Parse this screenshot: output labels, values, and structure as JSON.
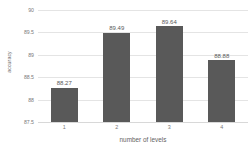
{
  "chart_data": {
    "type": "bar",
    "title": "",
    "subtitle": "",
    "xlabel": "number of levels",
    "ylabel": "accuracy",
    "categories": [
      "1",
      "2",
      "3",
      "4"
    ],
    "values": [
      88.27,
      89.49,
      89.64,
      88.88
    ],
    "data_labels": [
      "88.27",
      "89.49",
      "89.64",
      "88.88"
    ],
    "ylim": [
      87.5,
      90
    ],
    "ytick_labels": [
      "90",
      "89.5",
      "89",
      "88.5",
      "88",
      "87.5"
    ],
    "ytick_values": [
      90,
      89.5,
      89,
      88.5,
      88,
      87.5
    ],
    "grid": true,
    "grid_orientation": "horizontal",
    "legend": false,
    "legend_position": "none",
    "bar_color": "#595959",
    "gridline_color": "#e4e4e4",
    "text_color": "#7a7a7a",
    "background": "#ffffff"
  }
}
